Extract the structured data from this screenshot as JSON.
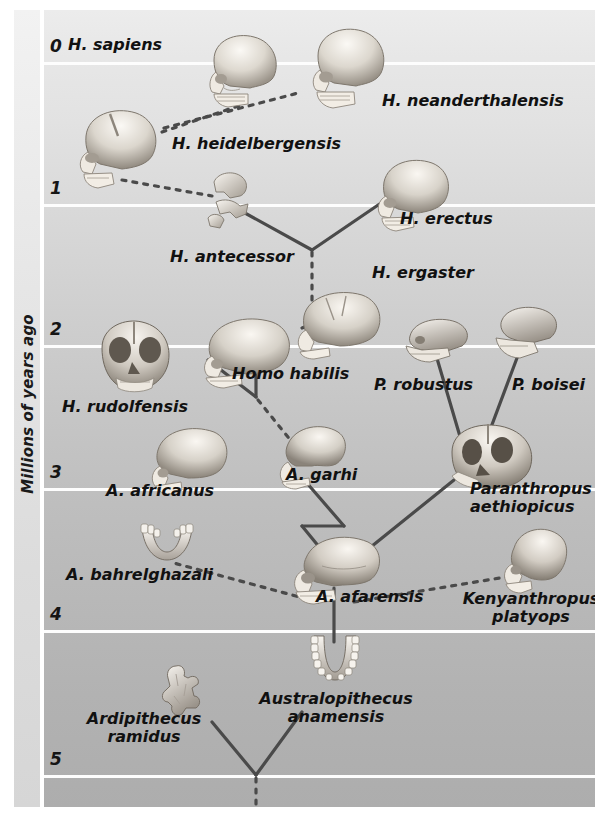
{
  "figure": {
    "type": "phylogenetic-tree",
    "axis": {
      "label": "Millions of years ago",
      "orientation": "vertical",
      "direction": "top = present (0), bottom = past (5)",
      "ticks": [
        "0",
        "1",
        "2",
        "3",
        "4",
        "5"
      ],
      "range": [
        0,
        5
      ],
      "unit": "million years ago"
    },
    "legend_implicit": {
      "solid_line": "established ancestor-descendant relationship",
      "dotted_line": "uncertain or hypothesised relationship"
    },
    "background": {
      "top_color": "#ececec",
      "bottom_color": "#adadad",
      "gridline_color": "#fdfdfd"
    }
  },
  "taxa": [
    {
      "id": "h-sapiens",
      "label": "H. sapiens",
      "age_mya": 0.05,
      "icon": "skull-icon"
    },
    {
      "id": "h-neanderthalensis",
      "label": "H. neanderthalensis",
      "age_mya": 0.12,
      "icon": "skull-icon"
    },
    {
      "id": "h-heidelbergensis",
      "label": "H. heidelbergensis",
      "age_mya": 0.6,
      "icon": "skull-icon"
    },
    {
      "id": "h-antecessor",
      "label": "H. antecessor",
      "age_mya": 0.9,
      "icon": "skull-fragment-icon"
    },
    {
      "id": "h-erectus",
      "label": "H. erectus",
      "age_mya": 1.1,
      "icon": "skull-icon"
    },
    {
      "id": "h-ergaster",
      "label": "H. ergaster",
      "age_mya": 1.6,
      "icon": "skull-icon"
    },
    {
      "id": "h-rudolfensis",
      "label": "H. rudolfensis",
      "age_mya": 2.1,
      "icon": "skull-front-icon"
    },
    {
      "id": "homo-habilis",
      "label": "Homo habilis",
      "age_mya": 2.1,
      "icon": "skull-icon"
    },
    {
      "id": "p-robustus",
      "label": "P. robustus",
      "age_mya": 2.05,
      "icon": "skull-fragment-icon"
    },
    {
      "id": "p-boisei",
      "label": "P. boisei",
      "age_mya": 2.05,
      "icon": "skull-fragment-icon"
    },
    {
      "id": "a-africanus",
      "label": "A. africanus",
      "age_mya": 2.9,
      "icon": "skull-icon"
    },
    {
      "id": "a-garhi",
      "label": "A. garhi",
      "age_mya": 2.9,
      "icon": "skull-icon"
    },
    {
      "id": "paranthropus-aethiopicus",
      "label": "Paranthropus\naethiopicus",
      "age_mya": 2.95,
      "icon": "skull-front-icon"
    },
    {
      "id": "a-bahrelghazali",
      "label": "A. bahrelghazali",
      "age_mya": 3.45,
      "icon": "jaw-icon"
    },
    {
      "id": "a-afarensis",
      "label": "A. afarensis",
      "age_mya": 3.55,
      "icon": "skull-icon"
    },
    {
      "id": "kenyanthropus-platyops",
      "label": "Kenyanthropus\nplatyops",
      "age_mya": 3.55,
      "icon": "skull-icon"
    },
    {
      "id": "australopithecus-anamensis",
      "label": "Australopithecus\nanamensis",
      "age_mya": 4.2,
      "icon": "jaw-icon"
    },
    {
      "id": "ardipithecus-ramidus",
      "label": "Ardipithecus\nramidus",
      "age_mya": 4.45,
      "icon": "bone-fragment-icon"
    }
  ],
  "links": [
    {
      "from": "h-heidelbergensis",
      "to": "h-sapiens",
      "style": "dotted"
    },
    {
      "from": "h-heidelbergensis",
      "to": "h-neanderthalensis",
      "style": "dotted"
    },
    {
      "from": "h-heidelbergensis",
      "to": "h-antecessor",
      "style": "dotted"
    },
    {
      "from": "h-antecessor",
      "to": "h-erectus",
      "style": "solid"
    },
    {
      "from": "h-ergaster",
      "to": "h-antecessor",
      "style": "dotted"
    },
    {
      "from": "homo-habilis",
      "to": "h-ergaster",
      "style": "dotted"
    },
    {
      "from": "homo-habilis",
      "to": "h-rudolfensis",
      "style": "solid"
    },
    {
      "from": "a-africanus",
      "to": "homo-habilis",
      "style": "dotted"
    },
    {
      "from": "paranthropus-aethiopicus",
      "to": "p-robustus",
      "style": "solid"
    },
    {
      "from": "paranthropus-aethiopicus",
      "to": "p-boisei",
      "style": "solid"
    },
    {
      "from": "a-afarensis",
      "to": "a-africanus",
      "style": "solid"
    },
    {
      "from": "a-afarensis",
      "to": "a-garhi",
      "style": "solid"
    },
    {
      "from": "a-afarensis",
      "to": "paranthropus-aethiopicus",
      "style": "solid"
    },
    {
      "from": "a-afarensis",
      "to": "a-bahrelghazali",
      "style": "dotted"
    },
    {
      "from": "a-afarensis",
      "to": "kenyanthropus-platyops",
      "style": "dotted"
    },
    {
      "from": "australopithecus-anamensis",
      "to": "a-afarensis",
      "style": "solid"
    },
    {
      "from": "root",
      "to": "australopithecus-anamensis",
      "style": "solid"
    },
    {
      "from": "root",
      "to": "ardipithecus-ramidus",
      "style": "solid"
    },
    {
      "from": "root",
      "to": "unknown-ancestor",
      "style": "dotted"
    }
  ],
  "colors": {
    "line": "#4a4a4a",
    "text": "#111111",
    "gridline": "#fdfdfd",
    "skull_light": "#f4f1ec",
    "skull_mid": "#c9c4bb",
    "skull_dark": "#8d867c"
  }
}
